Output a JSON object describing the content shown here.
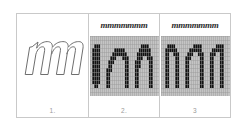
{
  "figure": {
    "background_color": "#ffffff",
    "frame_border_color": "#c9c9c9",
    "panel_count": 3
  },
  "panels": [
    {
      "id": "panel-1",
      "caption": "1.",
      "kind": "vector-outline",
      "glyph": "m",
      "glyph_style": "italic-outline",
      "sample_label": "",
      "outline_stroke_color": "#6e6e6e",
      "fill_color": "#ffffff",
      "has_pixel_grid": false
    },
    {
      "id": "panel-2",
      "caption": "2.",
      "kind": "raster-unhinted",
      "glyph": "m",
      "sample_label": "mmmmmmm",
      "grid_line_color": "#9a9a9a",
      "grid_background_color": "#c4c4c4",
      "ink_color": "#111111",
      "has_pixel_grid": true,
      "grid_cols": 34,
      "grid_rows": 15
    },
    {
      "id": "panel-3",
      "caption": "3",
      "kind": "raster-hinted",
      "glyph": "m",
      "sample_label": "mmmmmmm",
      "grid_line_color": "#9a9a9a",
      "grid_background_color": "#c4c4c4",
      "ink_color": "#111111",
      "has_pixel_grid": true,
      "grid_cols": 34,
      "grid_rows": 15
    }
  ],
  "colors": {
    "page_background": "#ffffff",
    "frame_border": "#c9c9c9",
    "caption_text": "#9a9a9a",
    "label_text": "#2b2b2b",
    "raster_ink": "#111111",
    "raster_grid": "#9a9a9a"
  }
}
